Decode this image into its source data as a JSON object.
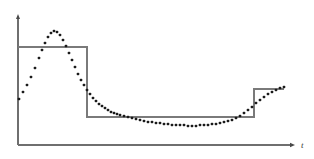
{
  "figure": {
    "background_color": "#ffffff",
    "axis_color": "#6f6f6f",
    "step_color": "#7a7a7a",
    "marker_color": "#1a1a1a",
    "width": 314,
    "height": 159
  },
  "axes": {
    "x_axis_label": "t",
    "y_axis_label": "",
    "origin": {
      "x": 18,
      "y": 145
    },
    "x_axis_end": {
      "x": 295,
      "y": 145
    },
    "y_axis_top": {
      "x": 18,
      "y": 14
    },
    "x_label_position": {
      "x": 301,
      "y": 148
    },
    "grid": false,
    "tick_labels_x": [],
    "tick_labels_y": []
  },
  "chart_data": {
    "type": "line",
    "title": "",
    "subtitle": "",
    "xlabel": "t",
    "ylabel": "",
    "xlim": [
      18,
      295
    ],
    "ylim": [
      145,
      14
    ],
    "grid": false,
    "legend": "none",
    "annotations": [],
    "series": [
      {
        "name": "sampled-signal",
        "style": "markers",
        "marker": "square-dot",
        "marker_size": 2.6,
        "color": "#1a1a1a",
        "points": [
          [
            19,
            99
          ],
          [
            23,
            92
          ],
          [
            27,
            85
          ],
          [
            31,
            77
          ],
          [
            35,
            68
          ],
          [
            39,
            58
          ],
          [
            42,
            50
          ],
          [
            45,
            43
          ],
          [
            48,
            37
          ],
          [
            51,
            33
          ],
          [
            54,
            31
          ],
          [
            57,
            32
          ],
          [
            60,
            35
          ],
          [
            63,
            40
          ],
          [
            66,
            46
          ],
          [
            69,
            53
          ],
          [
            72,
            60
          ],
          [
            75,
            67
          ],
          [
            78,
            74
          ],
          [
            81,
            80
          ],
          [
            84,
            85
          ],
          [
            87,
            90
          ],
          [
            90,
            94
          ],
          [
            93,
            98
          ],
          [
            96,
            101
          ],
          [
            99,
            104
          ],
          [
            102,
            106
          ],
          [
            105,
            108
          ],
          [
            108,
            110
          ],
          [
            111,
            112
          ],
          [
            114,
            113
          ],
          [
            117,
            114
          ],
          [
            120,
            115
          ],
          [
            124,
            116
          ],
          [
            128,
            117
          ],
          [
            132,
            118
          ],
          [
            136,
            119
          ],
          [
            140,
            120
          ],
          [
            144,
            121
          ],
          [
            148,
            122
          ],
          [
            152,
            122
          ],
          [
            156,
            123
          ],
          [
            160,
            123
          ],
          [
            164,
            124
          ],
          [
            168,
            124
          ],
          [
            172,
            125
          ],
          [
            176,
            125
          ],
          [
            180,
            125
          ],
          [
            184,
            125
          ],
          [
            188,
            126
          ],
          [
            192,
            126
          ],
          [
            196,
            126
          ],
          [
            200,
            125
          ],
          [
            204,
            125
          ],
          [
            208,
            125
          ],
          [
            212,
            124
          ],
          [
            216,
            124
          ],
          [
            220,
            123
          ],
          [
            224,
            122
          ],
          [
            228,
            121
          ],
          [
            232,
            120
          ],
          [
            236,
            118
          ],
          [
            240,
            116
          ],
          [
            244,
            113
          ],
          [
            248,
            110
          ],
          [
            252,
            107
          ],
          [
            256,
            103
          ],
          [
            260,
            100
          ],
          [
            264,
            97
          ],
          [
            268,
            94
          ],
          [
            272,
            92
          ],
          [
            276,
            90
          ],
          [
            280,
            88
          ],
          [
            284,
            87
          ]
        ]
      },
      {
        "name": "quantized-step-approximation",
        "style": "step",
        "color": "#7a7a7a",
        "step_levels": [
          {
            "x_start": 18,
            "x_end": 87,
            "y": 47
          },
          {
            "x_start": 87,
            "x_end": 254,
            "y": 117
          },
          {
            "x_start": 254,
            "x_end": 284,
            "y": 89
          }
        ]
      }
    ]
  }
}
